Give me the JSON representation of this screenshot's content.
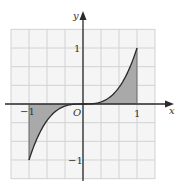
{
  "chart_data": {
    "type": "line",
    "title": "",
    "function": "y = x^3",
    "xlabel": "x",
    "ylabel": "y",
    "origin_label": "O",
    "xlim": [
      -1.33,
      1.33
    ],
    "ylim": [
      -1.33,
      1.33
    ],
    "grid": true,
    "grid_step": 0.3333,
    "x_ticks": [
      {
        "value": -1,
        "label": "−1"
      },
      {
        "value": 1,
        "label": "1"
      }
    ],
    "y_ticks": [
      {
        "value": 1,
        "label": "1"
      },
      {
        "value": -1,
        "label": "−1"
      }
    ],
    "x": [
      -1,
      -0.9,
      -0.8,
      -0.7,
      -0.6,
      -0.5,
      -0.4,
      -0.3,
      -0.2,
      -0.1,
      0,
      0.1,
      0.2,
      0.3,
      0.4,
      0.5,
      0.6,
      0.7,
      0.8,
      0.9,
      1
    ],
    "values": [
      -1,
      -0.729,
      -0.512,
      -0.343,
      -0.216,
      -0.125,
      -0.064,
      -0.027,
      -0.008,
      -0.001,
      0,
      0.001,
      0.008,
      0.027,
      0.064,
      0.125,
      0.216,
      0.343,
      0.512,
      0.729,
      1
    ],
    "shaded_regions": [
      {
        "from": -1,
        "to": 0,
        "between": "curve and x-axis"
      },
      {
        "from": 0,
        "to": 1,
        "between": "curve and x-axis"
      }
    ],
    "colors": {
      "shade": "#a9a9a9",
      "grid": "#d2d2d2",
      "grid_bg": "#f5f5f5",
      "axis": "#2a2a2a",
      "curve": "#2a2a2a"
    }
  },
  "labels": {
    "x_axis": "x",
    "y_axis": "y",
    "origin": "O",
    "x_neg1": "−1",
    "x_pos1": "1",
    "y_pos1": "1",
    "y_neg1": "−1"
  }
}
